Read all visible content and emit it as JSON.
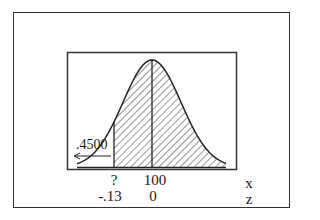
{
  "figure": {
    "type": "normal-distribution-diagram",
    "area_label": ".4500",
    "x_axis_name": "x",
    "z_axis_name": "z",
    "ticks": [
      {
        "x_value": "?",
        "z_value": "-.13",
        "position": "cutoff"
      },
      {
        "x_value": "100",
        "z_value": "0",
        "position": "mean"
      }
    ],
    "shaded_region": "between cutoff and right tail",
    "arrow_direction": "left"
  }
}
